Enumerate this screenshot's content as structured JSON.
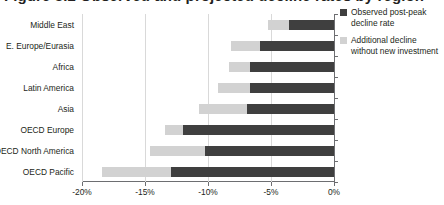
{
  "title_partial": "Figure 3.2  Observed and projected decline rates by region",
  "legend": {
    "position": "right",
    "items": [
      {
        "label": "Observed post-peak decline rate",
        "color": "#3f3f3f",
        "key": "observed"
      },
      {
        "label": "Additional decline without new investment",
        "color": "#d2d2d2",
        "key": "additional"
      }
    ]
  },
  "axis": {
    "ticks": [
      "-20%",
      "-15%",
      "-10%",
      "-5%",
      "0%"
    ],
    "tick_values": [
      -20,
      -15,
      -10,
      -5,
      0
    ],
    "xmin": -20,
    "xmax": 0
  },
  "chart_data": {
    "type": "bar",
    "orientation": "horizontal",
    "stacked": true,
    "title": "Figure 3.2  Observed and projected decline rates by region",
    "xlabel": "",
    "ylabel": "",
    "xlim": [
      -20,
      0
    ],
    "grid": true,
    "categories": [
      "Middle East",
      "E. Europe/Eurasia",
      "Africa",
      "Latin America",
      "Asia",
      "OECD Europe",
      "OECD North America",
      "OECD Pacific"
    ],
    "series": [
      {
        "name": "Observed post-peak decline rate",
        "color": "#3f3f3f",
        "values": [
          -3.6,
          -5.9,
          -6.7,
          -6.7,
          -6.9,
          -12.0,
          -10.2,
          -12.9
        ]
      },
      {
        "name": "Additional decline without new investment",
        "color": "#d2d2d2",
        "values": [
          -1.6,
          -2.3,
          -1.6,
          -2.5,
          -3.8,
          -1.4,
          -4.4,
          -5.5
        ]
      }
    ],
    "totals": [
      -5.2,
      -8.2,
      -8.3,
      -9.2,
      -10.7,
      -13.4,
      -14.6,
      -18.4
    ],
    "legend_position": "right",
    "units": "percent per year"
  }
}
